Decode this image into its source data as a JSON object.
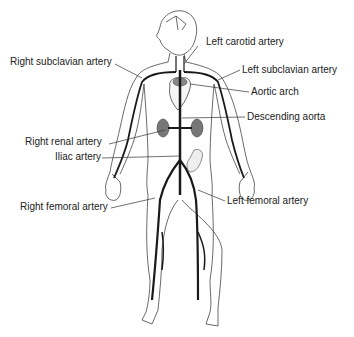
{
  "diagram": {
    "type": "anatomical-arterial-system",
    "colors": {
      "outline": "#333333",
      "artery": "#1a1a1a",
      "organ_fill": "#777777",
      "label_text": "#222222",
      "background": "#ffffff"
    },
    "labels": [
      {
        "id": "left-carotid-artery",
        "text": "Left carotid artery"
      },
      {
        "id": "right-subclavian-artery",
        "text": "Right subclavian artery"
      },
      {
        "id": "left-subclavian-artery",
        "text": "Left subclavian artery"
      },
      {
        "id": "aortic-arch",
        "text": "Aortic arch"
      },
      {
        "id": "descending-aorta",
        "text": "Descending aorta"
      },
      {
        "id": "right-renal-artery",
        "text": "Right renal artery"
      },
      {
        "id": "iliac-artery",
        "text": "Iliac artery"
      },
      {
        "id": "right-femoral-artery",
        "text": "Right femoral artery"
      },
      {
        "id": "left-femoral-artery",
        "text": "Left femoral artery"
      }
    ]
  }
}
